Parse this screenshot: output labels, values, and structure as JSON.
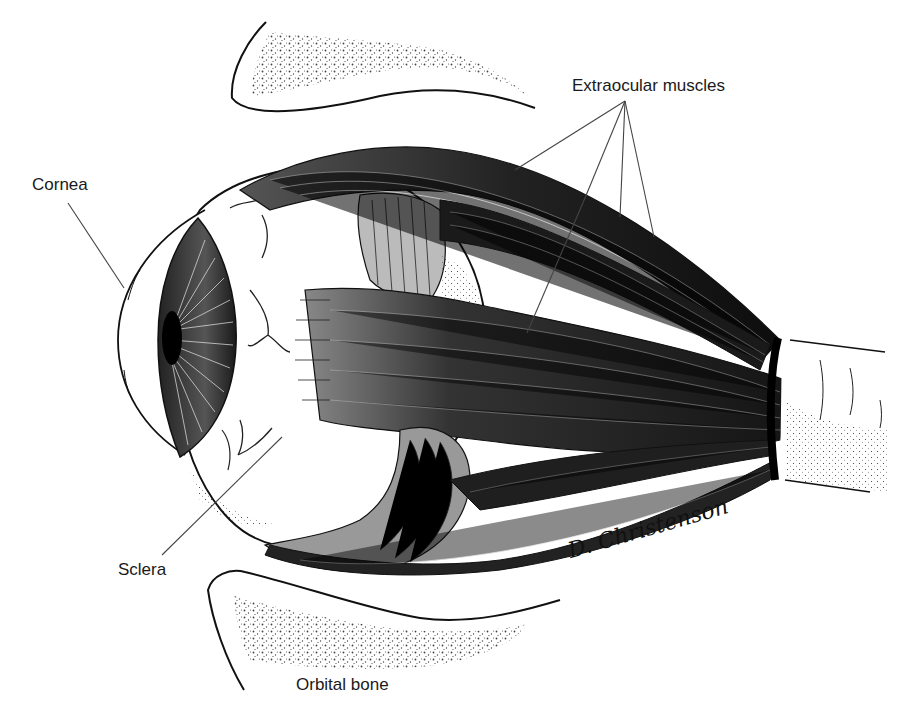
{
  "figure": {
    "labels": {
      "extraocular_muscles": "Extraocular muscles",
      "cornea": "Cornea",
      "sclera": "Sclera",
      "orbital_bone": "Orbital bone"
    },
    "signature": "D. Christenson",
    "colors": {
      "background": "#ffffff",
      "ink": "#111111",
      "leader_line": "#444444"
    }
  }
}
